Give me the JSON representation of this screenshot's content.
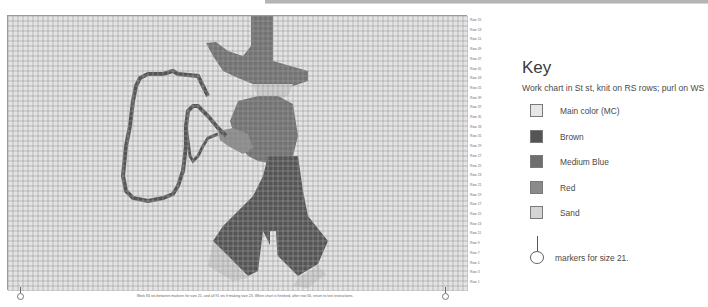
{
  "header": {
    "bar": "top-divider"
  },
  "chart": {
    "grid_columns": 91,
    "grid_rows": 55,
    "cell_size_px": 5,
    "colors": {
      "main_color": "#e4e4e4",
      "brown": "#555555",
      "medium_blue": "#737373",
      "red": "#8c8c8c",
      "sand": "#cfcfcf",
      "grid_line": "#9b9b9b"
    },
    "row_labels": [
      "Row 55",
      "Row 53",
      "Row 51",
      "Row 49",
      "Row 47",
      "Row 45",
      "Row 43",
      "Row 41",
      "Row 39",
      "Row 37",
      "Row 35",
      "Row 33",
      "Row 31",
      "Row 29",
      "Row 27",
      "Row 25",
      "Row 23",
      "Row 21",
      "Row 19",
      "Row 17",
      "Row 15",
      "Row 13",
      "Row 11",
      "Row 9",
      "Row 7",
      "Row 5",
      "Row 3",
      "Row 1"
    ],
    "footnote": "Work 84 sts between markers for size 21, and all 91 sts if making size 23. When chart is finished, after row 56, return to text instructions."
  },
  "key": {
    "title": "Key",
    "note": "Work chart in St st, knit on RS rows; purl on WS",
    "items": [
      {
        "label": "Main color (MC)",
        "color": "#e6e6e6"
      },
      {
        "label": "Brown",
        "color": "#555555"
      },
      {
        "label": "Medium Blue",
        "color": "#6e6e6e"
      },
      {
        "label": "Red",
        "color": "#8a8a8a"
      },
      {
        "label": "Sand",
        "color": "#d4d4d4"
      }
    ],
    "marker_label": "markers for size 21."
  }
}
